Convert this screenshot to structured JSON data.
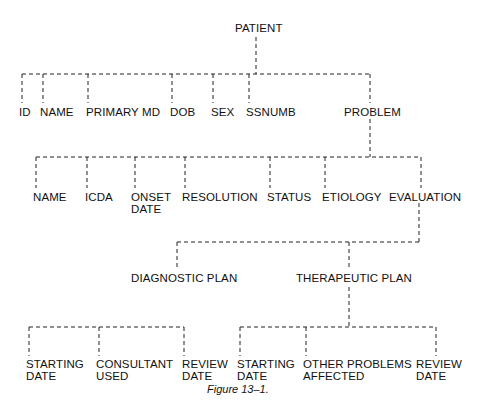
{
  "diagram": {
    "type": "hierarchical-data-tree",
    "root": "PATIENT",
    "nodes": {
      "patient": "PATIENT",
      "id": "ID",
      "name": "NAME",
      "primary_md": "PRIMARY MD",
      "dob": "DOB",
      "sex": "SEX",
      "ssnumb": "SSNUMB",
      "problem": "PROBLEM",
      "problem_name": "NAME",
      "icda": "ICDA",
      "onset_date_line1": "ONSET",
      "onset_date_line2": "DATE",
      "resolution": "RESOLUTION",
      "status": "STATUS",
      "etiology": "ETIOLOGY",
      "evaluation": "EVALUATION",
      "diagnostic_plan": "DIAGNOSTIC PLAN",
      "therapeutic_plan": "THERAPEUTIC PLAN",
      "dx_starting_date_line1": "STARTING",
      "dx_starting_date_line2": "DATE",
      "dx_consultant_used_line1": "CONSULTANT",
      "dx_consultant_used_line2": "USED",
      "dx_review_date_line1": "REVIEW",
      "dx_review_date_line2": "DATE",
      "tx_starting_date_line1": "STARTING",
      "tx_starting_date_line2": "DATE",
      "tx_other_problems_line1": "OTHER PROBLEMS",
      "tx_other_problems_line2": "AFFECTED",
      "tx_review_date_line1": "REVIEW",
      "tx_review_date_line2": "DATE"
    },
    "edges": [
      [
        "PATIENT",
        "ID"
      ],
      [
        "PATIENT",
        "NAME"
      ],
      [
        "PATIENT",
        "PRIMARY MD"
      ],
      [
        "PATIENT",
        "DOB"
      ],
      [
        "PATIENT",
        "SEX"
      ],
      [
        "PATIENT",
        "SSNUMB"
      ],
      [
        "PATIENT",
        "PROBLEM"
      ],
      [
        "PROBLEM",
        "NAME"
      ],
      [
        "PROBLEM",
        "ICDA"
      ],
      [
        "PROBLEM",
        "ONSET DATE"
      ],
      [
        "PROBLEM",
        "RESOLUTION"
      ],
      [
        "PROBLEM",
        "STATUS"
      ],
      [
        "PROBLEM",
        "ETIOLOGY"
      ],
      [
        "PROBLEM",
        "EVALUATION"
      ],
      [
        "EVALUATION",
        "DIAGNOSTIC PLAN"
      ],
      [
        "EVALUATION",
        "THERAPEUTIC PLAN"
      ],
      [
        "DIAGNOSTIC PLAN",
        "STARTING DATE"
      ],
      [
        "DIAGNOSTIC PLAN",
        "CONSULTANT USED"
      ],
      [
        "DIAGNOSTIC PLAN",
        "REVIEW DATE"
      ],
      [
        "THERAPEUTIC PLAN",
        "STARTING DATE"
      ],
      [
        "THERAPEUTIC PLAN",
        "OTHER PROBLEMS AFFECTED"
      ],
      [
        "THERAPEUTIC PLAN",
        "REVIEW DATE"
      ]
    ],
    "line_style": "dashed",
    "line_color": "#222222",
    "text_color": "#111111",
    "background": "#ffffff"
  },
  "caption": "Figure 13–1."
}
